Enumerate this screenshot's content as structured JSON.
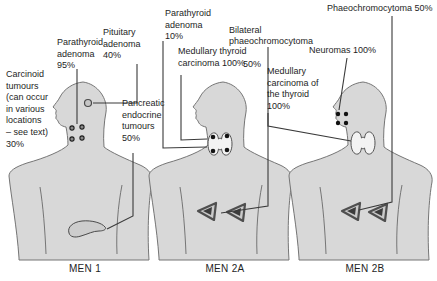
{
  "diagram_title": "Multiple endocrine neoplasia syndromes",
  "figures": [
    {
      "id": "men1",
      "caption": "MEN 1",
      "labels": [
        {
          "name": "carcinoid-tumours",
          "text": "Carcinoid\ntumours\n(can occur\nin various\nlocations\n– see text)\n30%"
        },
        {
          "name": "parathyroid-adenoma",
          "text": "Parathyroid\nadenoma\n95%"
        },
        {
          "name": "pituitary-adenoma",
          "text": "Pituitary\nadenoma\n40%"
        },
        {
          "name": "pancreatic-endocrine-tumours",
          "text": "Pancreatic\nendocrine\ntumours\n50%"
        }
      ],
      "organs": [
        "pituitary-gland",
        "parathyroid-glands",
        "pancreas"
      ]
    },
    {
      "id": "men2a",
      "caption": "MEN 2A",
      "labels": [
        {
          "name": "parathyroid-adenoma",
          "text": "Parathyroid\nadenoma\n10%"
        },
        {
          "name": "medullary-thyroid-carcinoma",
          "text": "Medullary thyroid\ncarcinoma 100%"
        },
        {
          "name": "bilateral-phaeochromocytoma",
          "text": "Bilateral\nphaeochromocytoma",
          "pct": "50%"
        }
      ],
      "organs": [
        "thyroid-gland-with-parathyroids",
        "adrenal-glands"
      ]
    },
    {
      "id": "men2b",
      "caption": "MEN 2B",
      "labels": [
        {
          "name": "phaeochromocytoma",
          "text": "Phaeochromocytoma 50%"
        },
        {
          "name": "neuromas",
          "text": "Neuromas 100%"
        },
        {
          "name": "medullary-carcinoma-of-thyroid",
          "text": "Medullary\ncarcinoma of\nthe thyroid\n100%"
        }
      ],
      "organs": [
        "lip-neuromas",
        "thyroid-gland",
        "adrenal-glands"
      ]
    }
  ],
  "icons": {
    "pituitary": "pituitary-gland-circle",
    "parathyroid": "parathyroid-dot-cluster",
    "pancreas": "pancreas-blob",
    "thyroid": "thyroid-butterfly",
    "adrenal": "adrenal-triangle",
    "neuromas": "lip-dot-cluster"
  },
  "colors": {
    "background": "#ffffff",
    "body_fill": "#d8d8d8",
    "body_outline": "#757575",
    "leader_line": "#3a3a3a",
    "text": "#1e1e1e",
    "organ_dot": "#141414",
    "thyroid_fill": "#f3f3f3",
    "pancreas_fill": "#cdcdcd",
    "adrenal_fill": "#c9c9c9",
    "adrenal_inner": "#3c3c3c"
  }
}
